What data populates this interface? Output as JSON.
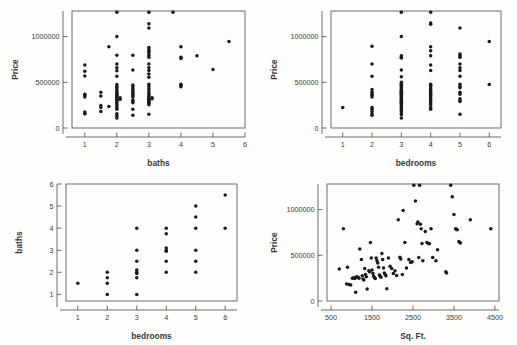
{
  "figure": {
    "background_color": "#fdfdfb",
    "marker_color": "#1a1a1a",
    "axis_color": "#5c5c5c",
    "panel_count": 4
  },
  "panels": [
    {
      "id": "price-vs-baths",
      "name": "Price vs baths",
      "xlabel": "baths",
      "ylabel": "Price",
      "xticks": [
        "1",
        "2",
        "3",
        "4",
        "5",
        "6"
      ],
      "yticks": [
        "0",
        "500000",
        "1000000"
      ]
    },
    {
      "id": "price-vs-bedrooms",
      "name": "Price vs bedrooms",
      "xlabel": "bedrooms",
      "ylabel": "Price",
      "xticks": [
        "1",
        "2",
        "3",
        "4",
        "5",
        "6"
      ],
      "yticks": [
        "0",
        "500000",
        "1000000"
      ]
    },
    {
      "id": "baths-vs-bedrooms",
      "name": "baths vs bedrooms",
      "xlabel": "bedrooms",
      "ylabel": "baths",
      "xticks": [
        "1",
        "2",
        "3",
        "4",
        "5",
        "6"
      ],
      "yticks": [
        "1",
        "2",
        "3",
        "4",
        "5",
        "6"
      ]
    },
    {
      "id": "price-vs-sqft",
      "name": "Price vs Sq. Ft.",
      "xlabel": "Sq. Ft.",
      "ylabel": "Price",
      "xticks": [
        "500",
        "1500",
        "2500",
        "3500",
        "4500"
      ],
      "yticks": [
        "0",
        "500000",
        "1000000"
      ]
    }
  ],
  "chart_data": [
    {
      "type": "scatter",
      "id": "price-vs-baths",
      "title": "",
      "xlabel": "baths",
      "ylabel": "Price",
      "xlim": [
        0.6,
        6.0
      ],
      "ylim": [
        0,
        1280000
      ],
      "xticks": [
        1,
        2,
        3,
        4,
        5,
        6
      ],
      "yticks": [
        0,
        500000,
        1000000
      ],
      "grid": false,
      "legend": "none",
      "points": [
        [
          1,
          690000
        ],
        [
          1,
          620000
        ],
        [
          1,
          570000
        ],
        [
          1,
          370000
        ],
        [
          1,
          355000
        ],
        [
          1,
          340000
        ],
        [
          1,
          175000
        ],
        [
          1,
          160000
        ],
        [
          1,
          155000
        ],
        [
          1.5,
          390000
        ],
        [
          1.5,
          350000
        ],
        [
          1.5,
          245000
        ],
        [
          1.5,
          225000
        ],
        [
          1.5,
          180000
        ],
        [
          1.75,
          890000
        ],
        [
          1.75,
          235000
        ],
        [
          2,
          1265000
        ],
        [
          2,
          1000000
        ],
        [
          2,
          795000
        ],
        [
          2,
          700000
        ],
        [
          2,
          660000
        ],
        [
          2,
          625000
        ],
        [
          2,
          565000
        ],
        [
          2,
          475000
        ],
        [
          2,
          455000
        ],
        [
          2,
          440000
        ],
        [
          2,
          420000
        ],
        [
          2,
          400000
        ],
        [
          2,
          385000
        ],
        [
          2,
          370000
        ],
        [
          2,
          360000
        ],
        [
          2,
          350000
        ],
        [
          2,
          340000
        ],
        [
          2,
          330000
        ],
        [
          2,
          320000
        ],
        [
          2,
          310000
        ],
        [
          2,
          300000
        ],
        [
          2,
          285000
        ],
        [
          2,
          265000
        ],
        [
          2,
          245000
        ],
        [
          2,
          225000
        ],
        [
          2,
          205000
        ],
        [
          2,
          155000
        ],
        [
          2,
          135000
        ],
        [
          2,
          110000
        ],
        [
          2.1,
          330000
        ],
        [
          2.1,
          315000
        ],
        [
          2.5,
          795000
        ],
        [
          2.5,
          635000
        ],
        [
          2.5,
          470000
        ],
        [
          2.5,
          450000
        ],
        [
          2.5,
          430000
        ],
        [
          2.5,
          410000
        ],
        [
          2.5,
          390000
        ],
        [
          2.5,
          370000
        ],
        [
          2.5,
          355000
        ],
        [
          2.5,
          340000
        ],
        [
          2.5,
          305000
        ],
        [
          2.5,
          290000
        ],
        [
          2.5,
          275000
        ],
        [
          2.5,
          205000
        ],
        [
          2.5,
          140000
        ],
        [
          3,
          1265000
        ],
        [
          3,
          1140000
        ],
        [
          3,
          1095000
        ],
        [
          3,
          880000
        ],
        [
          3,
          860000
        ],
        [
          3,
          840000
        ],
        [
          3,
          820000
        ],
        [
          3,
          795000
        ],
        [
          3,
          775000
        ],
        [
          3,
          700000
        ],
        [
          3,
          660000
        ],
        [
          3,
          630000
        ],
        [
          3,
          590000
        ],
        [
          3,
          555000
        ],
        [
          3,
          480000
        ],
        [
          3,
          455000
        ],
        [
          3,
          430000
        ],
        [
          3,
          405000
        ],
        [
          3,
          380000
        ],
        [
          3,
          360000
        ],
        [
          3,
          345000
        ],
        [
          3,
          330000
        ],
        [
          3,
          320000
        ],
        [
          3,
          310000
        ],
        [
          3,
          300000
        ],
        [
          3,
          290000
        ],
        [
          3,
          280000
        ],
        [
          3,
          270000
        ],
        [
          3,
          255000
        ],
        [
          3,
          150000
        ],
        [
          3.1,
          330000
        ],
        [
          3.1,
          320000
        ],
        [
          3.75,
          1265000
        ],
        [
          4,
          890000
        ],
        [
          4,
          775000
        ],
        [
          4,
          760000
        ],
        [
          4,
          480000
        ],
        [
          4,
          465000
        ],
        [
          4,
          450000
        ],
        [
          4.5,
          790000
        ],
        [
          5,
          640000
        ],
        [
          5.5,
          945000
        ]
      ]
    },
    {
      "type": "scatter",
      "id": "price-vs-bedrooms",
      "title": "",
      "xlabel": "bedrooms",
      "ylabel": "Price",
      "xlim": [
        0.6,
        6.4
      ],
      "ylim": [
        0,
        1280000
      ],
      "xticks": [
        1,
        2,
        3,
        4,
        5,
        6
      ],
      "yticks": [
        0,
        500000,
        1000000
      ],
      "grid": false,
      "legend": "none",
      "points": [
        [
          1,
          225000
        ],
        [
          2,
          895000
        ],
        [
          2,
          700000
        ],
        [
          2,
          565000
        ],
        [
          2,
          420000
        ],
        [
          2,
          390000
        ],
        [
          2,
          370000
        ],
        [
          2,
          355000
        ],
        [
          2,
          340000
        ],
        [
          2,
          225000
        ],
        [
          2,
          205000
        ],
        [
          2,
          180000
        ],
        [
          2,
          155000
        ],
        [
          2,
          140000
        ],
        [
          3,
          1265000
        ],
        [
          3,
          1000000
        ],
        [
          3,
          790000
        ],
        [
          3,
          775000
        ],
        [
          3,
          765000
        ],
        [
          3,
          635000
        ],
        [
          3,
          560000
        ],
        [
          3,
          500000
        ],
        [
          3,
          480000
        ],
        [
          3,
          470000
        ],
        [
          3,
          455000
        ],
        [
          3,
          440000
        ],
        [
          3,
          425000
        ],
        [
          3,
          410000
        ],
        [
          3,
          400000
        ],
        [
          3,
          390000
        ],
        [
          3,
          380000
        ],
        [
          3,
          370000
        ],
        [
          3,
          360000
        ],
        [
          3,
          350000
        ],
        [
          3,
          340000
        ],
        [
          3,
          330000
        ],
        [
          3,
          320000
        ],
        [
          3,
          310000
        ],
        [
          3,
          300000
        ],
        [
          3,
          290000
        ],
        [
          3,
          280000
        ],
        [
          3,
          270000
        ],
        [
          3,
          255000
        ],
        [
          3,
          240000
        ],
        [
          3,
          225000
        ],
        [
          3,
          205000
        ],
        [
          3,
          185000
        ],
        [
          3,
          165000
        ],
        [
          3,
          145000
        ],
        [
          3,
          110000
        ],
        [
          4,
          1265000
        ],
        [
          4,
          1150000
        ],
        [
          4,
          1135000
        ],
        [
          4,
          890000
        ],
        [
          4,
          845000
        ],
        [
          4,
          790000
        ],
        [
          4,
          690000
        ],
        [
          4,
          630000
        ],
        [
          4,
          480000
        ],
        [
          4,
          465000
        ],
        [
          4,
          450000
        ],
        [
          4,
          430000
        ],
        [
          4,
          415000
        ],
        [
          4,
          400000
        ],
        [
          4,
          385000
        ],
        [
          4,
          370000
        ],
        [
          4,
          355000
        ],
        [
          4,
          340000
        ],
        [
          4,
          320000
        ],
        [
          4,
          305000
        ],
        [
          4,
          290000
        ],
        [
          4,
          275000
        ],
        [
          4,
          255000
        ],
        [
          4,
          225000
        ],
        [
          4,
          205000
        ],
        [
          5,
          1095000
        ],
        [
          5,
          810000
        ],
        [
          5,
          790000
        ],
        [
          5,
          775000
        ],
        [
          5,
          700000
        ],
        [
          5,
          660000
        ],
        [
          5,
          630000
        ],
        [
          5,
          565000
        ],
        [
          5,
          480000
        ],
        [
          5,
          455000
        ],
        [
          5,
          440000
        ],
        [
          5,
          390000
        ],
        [
          5,
          370000
        ],
        [
          5,
          320000
        ],
        [
          5,
          300000
        ],
        [
          5,
          290000
        ],
        [
          5,
          150000
        ],
        [
          6,
          945000
        ],
        [
          6,
          475000
        ]
      ]
    },
    {
      "type": "scatter",
      "id": "baths-vs-bedrooms",
      "title": "",
      "xlabel": "bedrooms",
      "ylabel": "baths",
      "xlim": [
        0.6,
        6.4
      ],
      "ylim": [
        0.7,
        6.0
      ],
      "xticks": [
        1,
        2,
        3,
        4,
        5,
        6
      ],
      "yticks": [
        1,
        2,
        3,
        4,
        5,
        6
      ],
      "grid": false,
      "legend": "none",
      "points": [
        [
          1,
          1.5
        ],
        [
          2,
          2.0
        ],
        [
          2,
          1.75
        ],
        [
          2,
          1.5
        ],
        [
          2,
          1.0
        ],
        [
          3,
          4.0
        ],
        [
          3,
          3.0
        ],
        [
          3,
          2.5
        ],
        [
          3,
          2.1
        ],
        [
          3,
          2.0
        ],
        [
          3,
          1.95
        ],
        [
          3,
          1.75
        ],
        [
          3,
          1.0
        ],
        [
          4,
          4.0
        ],
        [
          4,
          3.75
        ],
        [
          4,
          3.1
        ],
        [
          4,
          3.0
        ],
        [
          4,
          2.95
        ],
        [
          4,
          2.5
        ],
        [
          4,
          2.0
        ],
        [
          5,
          5.0
        ],
        [
          5,
          4.5
        ],
        [
          5,
          4.0
        ],
        [
          5,
          3.0
        ],
        [
          5,
          2.5
        ],
        [
          5,
          2.0
        ],
        [
          6,
          5.5
        ],
        [
          6,
          4.0
        ]
      ]
    },
    {
      "type": "scatter",
      "id": "price-vs-sqft",
      "title": "",
      "xlabel": "Sq. Ft.",
      "ylabel": "Price",
      "xlim": [
        400,
        4600
      ],
      "ylim": [
        0,
        1280000
      ],
      "xticks": [
        500,
        1500,
        2500,
        3500,
        4500
      ],
      "yticks": [
        0,
        500000,
        1000000
      ],
      "grid": false,
      "legend": "none",
      "points": [
        [
          800,
          790000
        ],
        [
          700,
          350000
        ],
        [
          900,
          370000
        ],
        [
          880,
          185000
        ],
        [
          940,
          180000
        ],
        [
          980,
          175000
        ],
        [
          1020,
          250000
        ],
        [
          1050,
          255000
        ],
        [
          1080,
          245000
        ],
        [
          1100,
          95000
        ],
        [
          1120,
          265000
        ],
        [
          1160,
          260000
        ],
        [
          1180,
          250000
        ],
        [
          1200,
          570000
        ],
        [
          1240,
          455000
        ],
        [
          1260,
          275000
        ],
        [
          1280,
          240000
        ],
        [
          1300,
          230000
        ],
        [
          1320,
          355000
        ],
        [
          1340,
          290000
        ],
        [
          1360,
          265000
        ],
        [
          1380,
          130000
        ],
        [
          1420,
          330000
        ],
        [
          1440,
          320000
        ],
        [
          1460,
          640000
        ],
        [
          1480,
          470000
        ],
        [
          1500,
          340000
        ],
        [
          1520,
          300000
        ],
        [
          1540,
          270000
        ],
        [
          1560,
          255000
        ],
        [
          1580,
          245000
        ],
        [
          1600,
          470000
        ],
        [
          1620,
          440000
        ],
        [
          1640,
          415000
        ],
        [
          1660,
          370000
        ],
        [
          1680,
          285000
        ],
        [
          1700,
          270000
        ],
        [
          1720,
          260000
        ],
        [
          1740,
          520000
        ],
        [
          1760,
          455000
        ],
        [
          1780,
          360000
        ],
        [
          1800,
          305000
        ],
        [
          1820,
          290000
        ],
        [
          1840,
          275000
        ],
        [
          1860,
          135000
        ],
        [
          1900,
          470000
        ],
        [
          1940,
          380000
        ],
        [
          1980,
          355000
        ],
        [
          2020,
          300000
        ],
        [
          2060,
          330000
        ],
        [
          2100,
          280000
        ],
        [
          2140,
          890000
        ],
        [
          2180,
          480000
        ],
        [
          2200,
          460000
        ],
        [
          2240,
          290000
        ],
        [
          2260,
          990000
        ],
        [
          2300,
          640000
        ],
        [
          2340,
          360000
        ],
        [
          2400,
          455000
        ],
        [
          2440,
          420000
        ],
        [
          2480,
          430000
        ],
        [
          2520,
          1265000
        ],
        [
          2560,
          1095000
        ],
        [
          2600,
          845000
        ],
        [
          2620,
          865000
        ],
        [
          2640,
          475000
        ],
        [
          2660,
          1265000
        ],
        [
          2680,
          840000
        ],
        [
          2700,
          790000
        ],
        [
          2720,
          630000
        ],
        [
          2740,
          440000
        ],
        [
          2800,
          760000
        ],
        [
          2840,
          640000
        ],
        [
          2880,
          630000
        ],
        [
          2900,
          625000
        ],
        [
          2940,
          790000
        ],
        [
          2980,
          475000
        ],
        [
          3060,
          440000
        ],
        [
          3100,
          560000
        ],
        [
          3300,
          320000
        ],
        [
          3320,
          305000
        ],
        [
          3420,
          1265000
        ],
        [
          3460,
          1140000
        ],
        [
          3500,
          945000
        ],
        [
          3540,
          790000
        ],
        [
          3560,
          785000
        ],
        [
          3580,
          780000
        ],
        [
          3620,
          650000
        ],
        [
          3640,
          640000
        ],
        [
          3660,
          635000
        ],
        [
          3900,
          890000
        ],
        [
          4400,
          790000
        ]
      ]
    }
  ]
}
